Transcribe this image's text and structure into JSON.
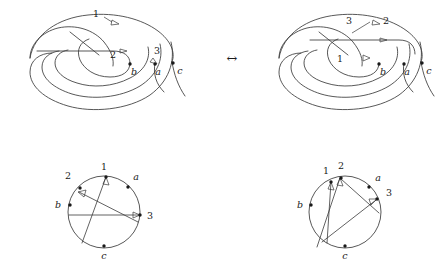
{
  "figure": {
    "background_color": "#ffffff",
    "stroke_color": "#3a3a3a",
    "label_color": "#1a1a1a",
    "relation_symbol": "↔"
  },
  "panels": {
    "top_left": {
      "name": "tangle-diagram-left",
      "labels": {
        "arrow_1": "1",
        "arrow_2": "2",
        "arrow_3": "3",
        "endpoint_b": "b",
        "endpoint_a": "a",
        "endpoint_c": "c"
      }
    },
    "top_right": {
      "name": "tangle-diagram-right",
      "labels": {
        "arrow_3": "3",
        "arrow_2": "2",
        "arrow_1": "1",
        "endpoint_b": "b",
        "endpoint_a": "a",
        "endpoint_c": "c"
      }
    },
    "bottom_left": {
      "name": "chord-diagram-left",
      "labels": {
        "point_2": "2",
        "point_1": "1",
        "point_a": "a",
        "point_b": "b",
        "point_3": "3",
        "point_c": "c"
      }
    },
    "bottom_right": {
      "name": "chord-diagram-right",
      "labels": {
        "point_1": "1",
        "point_2": "2",
        "point_a": "a",
        "point_3": "3",
        "point_b": "b",
        "point_c": "c"
      }
    }
  }
}
